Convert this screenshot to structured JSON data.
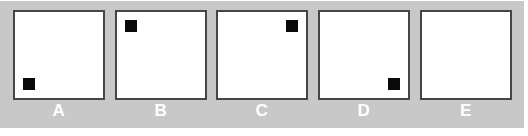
{
  "figure": {
    "type": "panel-series",
    "background_color": "#c8c8c8",
    "panel_fill_color": "#ffffff",
    "panel_border_color": "#464646",
    "marker_color": "#0a0a0a",
    "label_color": "#ffffff",
    "panel_count": 5,
    "panels": [
      {
        "label": "A",
        "marker_present": true,
        "marker_position": "bottom-left",
        "marker_shape": "square"
      },
      {
        "label": "B",
        "marker_present": true,
        "marker_position": "top-left",
        "marker_shape": "square"
      },
      {
        "label": "C",
        "marker_present": true,
        "marker_position": "top-right",
        "marker_shape": "square"
      },
      {
        "label": "D",
        "marker_present": true,
        "marker_position": "bottom-right",
        "marker_shape": "square"
      },
      {
        "label": "E",
        "marker_present": false,
        "marker_position": "none",
        "marker_shape": "none"
      }
    ]
  }
}
